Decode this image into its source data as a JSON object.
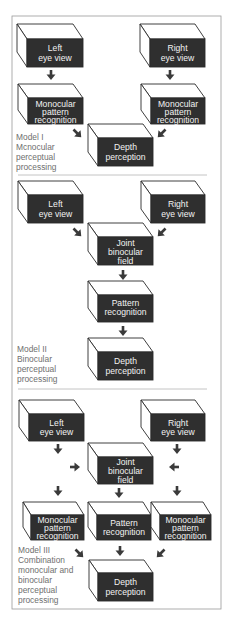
{
  "diagram": {
    "models": [
      {
        "label_lines": [
          "Model I",
          "Mcnocular",
          "perceptual",
          "processing"
        ],
        "boxes": {
          "left_eye": [
            "Left",
            "eye view"
          ],
          "right_eye": [
            "Right",
            "eye view"
          ],
          "left_mono": [
            "Monocular",
            "pattern",
            "recognition"
          ],
          "right_mono": [
            "Monocular",
            "pattern",
            "recognition"
          ],
          "depth": [
            "Depth",
            "perception"
          ]
        }
      },
      {
        "label_lines": [
          "Model II",
          "Binocular",
          "perceptual",
          "processing"
        ],
        "boxes": {
          "left_eye": [
            "Left",
            "eye view"
          ],
          "right_eye": [
            "Right",
            "eye view"
          ],
          "joint": [
            "Joint",
            "binocular",
            "field"
          ],
          "pattern": [
            "Pattern",
            "recognition"
          ],
          "depth": [
            "Depth",
            "perception"
          ]
        }
      },
      {
        "label_lines": [
          "Model III",
          "Combination",
          "monocular and",
          "binocular",
          "perceptual",
          "processing"
        ],
        "boxes": {
          "left_eye": [
            "Left",
            "eye view"
          ],
          "right_eye": [
            "Right",
            "eye view"
          ],
          "joint": [
            "Joint",
            "binocular",
            "field"
          ],
          "left_mono": [
            "Monocular",
            "pattern",
            "recognition"
          ],
          "pattern": [
            "Pattern",
            "recognition"
          ],
          "right_mono": [
            "Monocular",
            "pattern",
            "recognition"
          ],
          "depth": [
            "Depth",
            "perception"
          ]
        }
      }
    ],
    "colors": {
      "box_front": "#2f2f2f",
      "box_text": "#f2f2f2",
      "outline": "#2a2a2a",
      "label_text": "#6f6f6f",
      "frame": "#9a9a9a"
    }
  }
}
